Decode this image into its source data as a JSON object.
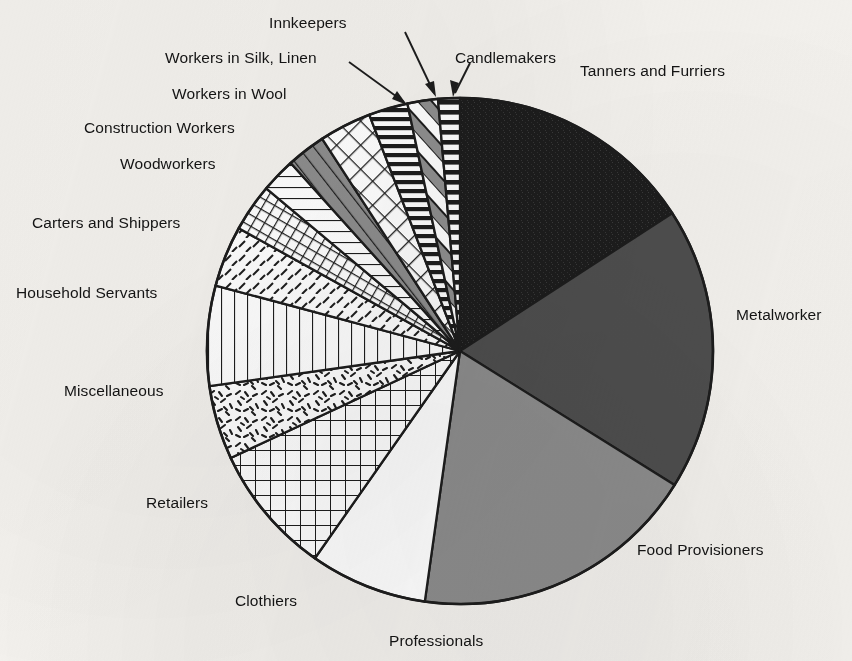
{
  "figure": {
    "kind": "pie-chart",
    "background_color": "#f4f2ee",
    "ink_color": "#141414"
  },
  "chart_data": {
    "type": "pie",
    "title": "",
    "subtitle": "",
    "xlabel": "",
    "ylabel": "",
    "legend_position": "callout-labels-around-pie",
    "grid": false,
    "start_angle_deg": 90,
    "direction": "clockwise",
    "units": "percent of workforce",
    "center_px": [
      460,
      351
    ],
    "radius_px": 253,
    "categories": [
      "Tanners and Furriers",
      "Metalworkers",
      "Food Provisioners",
      "Professionals",
      "Clothiers",
      "Retailers",
      "Miscellaneous",
      "Household Servants",
      "Carters and Shippers",
      "Woodworkers",
      "Construction Workers",
      "Workers in Wool",
      "Workers in Silk, Linen",
      "Innkeepers",
      "Candlemakers"
    ],
    "values": [
      15.8,
      18.1,
      18.3,
      7.5,
      8.3,
      4.7,
      6.4,
      3.9,
      3.1,
      2.2,
      2.5,
      3.3,
      2.5,
      1.9,
      1.5
    ],
    "slices": [
      {
        "label": "Tanners and Furriers",
        "value": 15.8,
        "start_deg": 0,
        "end_deg": 57,
        "fill": "solid-black",
        "color": "#1d1d1d"
      },
      {
        "label": "Metalworkers",
        "value": 18.1,
        "start_deg": 57,
        "end_deg": 122,
        "fill": "solid-dark-gray",
        "color": "#4e4e4e"
      },
      {
        "label": "Food Provisioners",
        "value": 18.3,
        "start_deg": 122,
        "end_deg": 188,
        "fill": "solid-mid-gray",
        "color": "#8d8d8d"
      },
      {
        "label": "Professionals",
        "value": 7.5,
        "start_deg": 188,
        "end_deg": 215,
        "fill": "solid-white",
        "color": "#ffffff"
      },
      {
        "label": "Clothiers",
        "value": 8.3,
        "start_deg": 215,
        "end_deg": 245,
        "fill": "fine-grid",
        "color": "#ffffff"
      },
      {
        "label": "Retailers",
        "value": 4.7,
        "start_deg": 245,
        "end_deg": 262,
        "fill": "speckle-dashes",
        "color": "#ffffff"
      },
      {
        "label": "Miscellaneous",
        "value": 6.4,
        "start_deg": 262,
        "end_deg": 285,
        "fill": "vertical-lines",
        "color": "#ffffff"
      },
      {
        "label": "Household Servants",
        "value": 3.9,
        "start_deg": 285,
        "end_deg": 299,
        "fill": "diagonal-dashes",
        "color": "#ffffff"
      },
      {
        "label": "Carters and Shippers",
        "value": 3.1,
        "start_deg": 299,
        "end_deg": 310,
        "fill": "cross-hatch",
        "color": "#ffffff"
      },
      {
        "label": "Woodworkers",
        "value": 2.2,
        "start_deg": 310,
        "end_deg": 318,
        "fill": "horizontal-lines",
        "color": "#ffffff"
      },
      {
        "label": "Construction Workers",
        "value": 2.5,
        "start_deg": 318,
        "end_deg": 327,
        "fill": "gray-diagonal-band",
        "color": "#8d8d8d"
      },
      {
        "label": "Workers in Wool",
        "value": 3.3,
        "start_deg": 327,
        "end_deg": 339,
        "fill": "diamond-grid",
        "color": "#ffffff"
      },
      {
        "label": "Workers in Silk, Linen",
        "value": 2.5,
        "start_deg": 339,
        "end_deg": 348,
        "fill": "bold-horizontal",
        "color": "#ffffff"
      },
      {
        "label": "Innkeepers",
        "value": 1.9,
        "start_deg": 348,
        "end_deg": 355,
        "fill": "bold-diagonal-gray",
        "color": "#9a9a9a"
      },
      {
        "label": "Candlemakers",
        "value": 1.5,
        "start_deg": 355,
        "end_deg": 360,
        "fill": "ladder-horizontal",
        "color": "#ffffff"
      }
    ]
  },
  "labels": {
    "innkeepers": "Innkeepers",
    "workers_in_silk_linen": "Workers in Silk, Linen",
    "candlemakers": "Candlemakers",
    "workers_in_wool": "Workers in Wool",
    "tanners_and_furriers": "Tanners and Furriers",
    "construction_workers": "Construction Workers",
    "woodworkers": "Woodworkers",
    "carters_and_shippers": "Carters and Shippers",
    "household_servants": "Household Servants",
    "metalworkers": "Metalworker",
    "miscellaneous": "Miscellaneous",
    "retailers": "Retailers",
    "food_provisioners": "Food Provisioners",
    "clothiers": "Clothiers",
    "professionals": "Professionals"
  }
}
